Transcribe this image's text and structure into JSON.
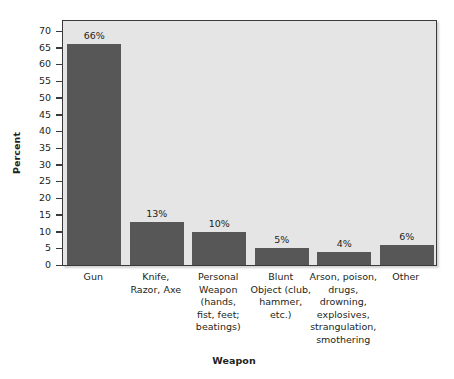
{
  "chart_data": {
    "type": "bar",
    "title": "",
    "xlabel": "Weapon",
    "ylabel": "Percent",
    "categories": [
      "Gun",
      "Knife,\nRazor, Axe",
      "Personal\nWeapon\n(hands,\nfist, feet;\nbeatings)",
      "Blunt\nObject (club,\nhammer,\netc.)",
      "Arson, poison,\ndrugs,\ndrowning,\nexplosives,\nstrangulation,\nsmothering",
      "Other"
    ],
    "values": [
      66,
      13,
      10,
      5,
      4,
      6
    ],
    "data_labels": [
      "66%",
      "13%",
      "10%",
      "5%",
      "4%",
      "6%"
    ],
    "ylim": [
      0,
      70
    ],
    "ytick_values": [
      0,
      5,
      10,
      15,
      20,
      25,
      30,
      35,
      40,
      45,
      50,
      55,
      60,
      65,
      70
    ],
    "ytick_labels": [
      "0",
      "5",
      "10",
      "15",
      "20",
      "25",
      "30",
      "35",
      "40",
      "45",
      "50",
      "55",
      "60",
      "65",
      "70"
    ],
    "grid": false,
    "legend": null,
    "colors": {
      "bar_fill": "#575757",
      "plot_background": "#e5e5e5",
      "frame": "#3a3a3a",
      "text": "#231f20",
      "figure_background": "#ffffff"
    }
  }
}
